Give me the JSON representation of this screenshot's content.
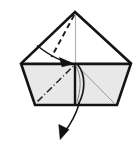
{
  "figure": {
    "kind": "line-drawing",
    "background_color": "#ffffff",
    "outline_color": "#141414",
    "crease_color": "#4a4a4a",
    "panel_fill": "#e8e8e8",
    "panel_fill_light": "#f2f2f2",
    "white_fill": "#ffffff",
    "canvas": {
      "width": 138,
      "height": 148
    }
  },
  "shape": {
    "name": "paper-body",
    "apex": {
      "x": 75,
      "y": 12
    },
    "left_vertex": {
      "x": 21,
      "y": 63.5
    },
    "right_vertex": {
      "x": 131,
      "y": 63.5
    },
    "bottom_left": {
      "x": 35,
      "y": 105
    },
    "bottom_right": {
      "x": 117,
      "y": 105
    },
    "outline_points": "75,12 131,63.5 117,105 35,105 21,63.5",
    "horizontal_edge": {
      "x1": 21,
      "y1": 63.5,
      "x2": 131,
      "y2": 63.5
    },
    "center_vertical": {
      "x1": 75,
      "y1": 12,
      "x2": 75,
      "y2": 105
    }
  },
  "panels": [
    {
      "name": "upper-left-triangle",
      "points": "75,12 75,63.5 21,63.5",
      "fill": "#ffffff"
    },
    {
      "name": "upper-right-triangle",
      "points": "75,12 131,63.5 75,63.5",
      "fill": "#ffffff"
    },
    {
      "name": "lower-left-panel",
      "points": "21,63.5 75,63.5 75,105 35,105",
      "fill": "#e8e8e8"
    },
    {
      "name": "lower-right-panel",
      "points": "75,63.5 131,63.5 117,105 75,105",
      "fill": "#e8e8e8"
    }
  ],
  "creases": [
    {
      "name": "apex-dashed-fold",
      "style": "dashed",
      "d": "M 74.5 14 L 52 56",
      "color": "#1a1a1a"
    },
    {
      "name": "lower-left-dash-dot-fold",
      "style": "dash-dot",
      "d": "M 37.5 101 L 74 65",
      "color": "#2a2a2a"
    },
    {
      "name": "lower-right-thin-diagonal",
      "style": "thin-solid",
      "d": "M 78 66 L 115 103",
      "color": "#8a8a8a"
    },
    {
      "name": "center-vertical-thin-line",
      "style": "thin-solid",
      "d": "M 75.5 14 L 75.5 104",
      "color": "#9a9a9a"
    }
  ],
  "arrows": [
    {
      "name": "fold-in-arrow",
      "description": "curved arrow from upper-left toward center point",
      "path": "M 38 46 Q 58 60 71 62",
      "head": "72,63.5 60,58 62.5,66.5"
    },
    {
      "name": "pull-out-arrow",
      "description": "long curved arrow from lower center down to bottom-left",
      "path": "M 78 104 Q 72 120 63 133",
      "head": "60.5,139 57,125 68,129"
    },
    {
      "name": "tuck-hook",
      "description": "small curved hook at center showing flap reversal",
      "path": "M 77 64 C 86 74 84 92 78 104"
    }
  ],
  "labels": {
    "caption": ""
  }
}
